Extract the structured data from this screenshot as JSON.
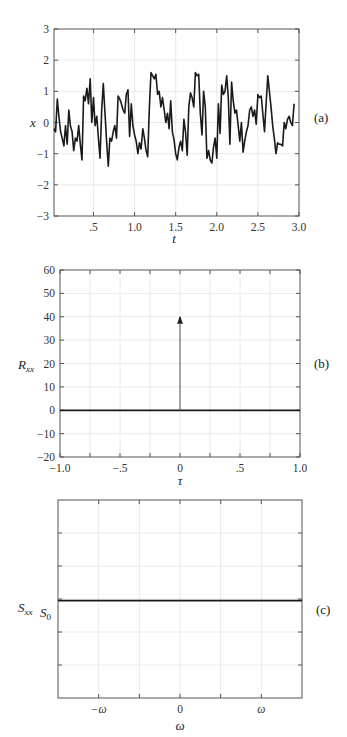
{
  "chart_data": [
    {
      "id": "a",
      "type": "line",
      "panel_label": "(a)",
      "title": "",
      "xlabel": "t",
      "ylabel": "x",
      "xlim": [
        0.02,
        3.0
      ],
      "ylim": [
        -3,
        3
      ],
      "grid": true,
      "x_ticks": [
        0.5,
        1.0,
        1.5,
        2.0,
        2.5,
        3.0
      ],
      "x_tick_labels": [
        ".5",
        "1.0",
        "1.5",
        "2.0",
        "2.5",
        "3.0"
      ],
      "y_ticks": [
        -3,
        -2,
        -1,
        0,
        1,
        2,
        3
      ],
      "y_tick_labels": [
        "−3",
        "−2",
        "−1",
        "0",
        "1",
        "2",
        "3"
      ],
      "series": [
        {
          "name": "x(t) random signal",
          "x": [
            0.02,
            0.04,
            0.06,
            0.08,
            0.1,
            0.12,
            0.14,
            0.16,
            0.18,
            0.2,
            0.22,
            0.24,
            0.26,
            0.28,
            0.3,
            0.32,
            0.34,
            0.36,
            0.38,
            0.4,
            0.42,
            0.44,
            0.46,
            0.48,
            0.5,
            0.52,
            0.54,
            0.56,
            0.58,
            0.6,
            0.62,
            0.64,
            0.66,
            0.68,
            0.7,
            0.72,
            0.74,
            0.76,
            0.78,
            0.8,
            0.82,
            0.84,
            0.86,
            0.88,
            0.9,
            0.92,
            0.94,
            0.96,
            0.98,
            1.0,
            1.02,
            1.04,
            1.06,
            1.08,
            1.1,
            1.12,
            1.14,
            1.16,
            1.18,
            1.2,
            1.22,
            1.24,
            1.26,
            1.28,
            1.3,
            1.32,
            1.34,
            1.36,
            1.38,
            1.4,
            1.42,
            1.44,
            1.46,
            1.48,
            1.5,
            1.52,
            1.54,
            1.56,
            1.58,
            1.6,
            1.62,
            1.64,
            1.66,
            1.68,
            1.7,
            1.72,
            1.74,
            1.76,
            1.78,
            1.8,
            1.82,
            1.84,
            1.86,
            1.88,
            1.9,
            1.92,
            1.94,
            1.96,
            1.98,
            2.0,
            2.02,
            2.04,
            2.06,
            2.08,
            2.1,
            2.12,
            2.14,
            2.16,
            2.18,
            2.2,
            2.22,
            2.24,
            2.26,
            2.28,
            2.3,
            2.32,
            2.34,
            2.36,
            2.38,
            2.4,
            2.42,
            2.44,
            2.46,
            2.48,
            2.5,
            2.52,
            2.54,
            2.56,
            2.58,
            2.6,
            2.62,
            2.64,
            2.66,
            2.68,
            2.7,
            2.72,
            2.74,
            2.76,
            2.78,
            2.8,
            2.82,
            2.84,
            2.86,
            2.88,
            2.9,
            2.92,
            2.94,
            2.96,
            2.98,
            3.0
          ],
          "y": [
            -0.2,
            -0.3,
            0.75,
            0.2,
            -0.3,
            -0.5,
            -0.75,
            -0.1,
            -0.7,
            0.4,
            -0.1,
            -0.3,
            -0.9,
            -0.5,
            -0.6,
            -0.1,
            -0.7,
            -1.2,
            0.85,
            0.7,
            1.1,
            0.6,
            1.4,
            0.0,
            0.8,
            -0.1,
            0.2,
            -0.5,
            -1.15,
            0.4,
            1.25,
            0.3,
            -0.6,
            -1.4,
            -0.5,
            -0.6,
            -0.3,
            -0.1,
            -0.5,
            0.85,
            0.75,
            0.6,
            0.4,
            0.3,
            0.9,
            1.05,
            -0.45,
            0.6,
            -0.1,
            -0.4,
            -0.6,
            -1.0,
            -0.65,
            -0.85,
            -0.2,
            -0.5,
            -0.9,
            -1.1,
            0.5,
            1.6,
            1.5,
            1.4,
            1.55,
            0.9,
            1.0,
            0.5,
            0.8,
            0.4,
            0.0,
            0.3,
            -0.2,
            0.7,
            -0.3,
            -0.55,
            -1.0,
            -1.2,
            -0.8,
            -0.6,
            -0.9,
            0.1,
            -0.3,
            -1.05,
            0.5,
            0.95,
            0.8,
            0.5,
            1.6,
            1.5,
            1.55,
            0.3,
            -0.4,
            1.0,
            0.5,
            -1.15,
            -0.9,
            -1.2,
            -1.3,
            -0.8,
            -0.5,
            -1.15,
            0.6,
            -0.35,
            1.2,
            0.9,
            1.0,
            1.5,
            0.8,
            -0.7,
            1.3,
            0.7,
            0.3,
            0.4,
            -0.1,
            -0.6,
            0.0,
            -0.95,
            -0.6,
            -0.3,
            -0.1,
            0.4,
            0.5,
            0.2,
            0.4,
            -0.05,
            0.9,
            0.8,
            0.85,
            0.3,
            -0.3,
            0.6,
            1.5,
            1.0,
            0.5,
            -0.1,
            -0.5,
            -1.0,
            -0.65,
            -0.7,
            -0.7,
            -0.75,
            0.0,
            -0.2,
            0.1,
            0.2,
            0.0,
            -0.1,
            0.6
          ]
        }
      ]
    },
    {
      "id": "b",
      "type": "line",
      "panel_label": "(b)",
      "title": "",
      "xlabel": "τ",
      "ylabel": "R_xx",
      "xlim": [
        -1.0,
        1.0
      ],
      "ylim": [
        -20,
        60
      ],
      "grid": true,
      "x_ticks": [
        -1.0,
        -0.75,
        -0.5,
        -0.25,
        0,
        0.25,
        0.5,
        0.75,
        1.0
      ],
      "x_tick_labels": [
        "−1.0",
        "",
        "−.5",
        "",
        "0",
        "",
        ".5",
        "",
        "1.0"
      ],
      "y_ticks": [
        -20,
        -10,
        0,
        10,
        20,
        30,
        40,
        50,
        60
      ],
      "y_tick_labels": [
        "−20",
        "−10",
        "0",
        "10",
        "20",
        "30",
        "40",
        "50",
        "60"
      ],
      "series": [
        {
          "name": "baseline",
          "x": [
            -1.0,
            1.0
          ],
          "y": [
            0,
            0
          ]
        },
        {
          "name": "impulse at tau=0 (arrow)",
          "x": [
            0,
            0
          ],
          "y": [
            0,
            40
          ]
        }
      ]
    },
    {
      "id": "c",
      "type": "line",
      "panel_label": "(c)",
      "title": "",
      "xlabel": "ω",
      "ylabel": "S_xx",
      "y_annotation": "S0",
      "xlim": [
        -1.5,
        1.5
      ],
      "ylim": [
        -3,
        3
      ],
      "grid": true,
      "x_ticks": [
        -1.0,
        -0.5,
        0,
        0.5,
        1.0
      ],
      "x_tick_labels": [
        "−ω",
        "",
        "0",
        "",
        "ω"
      ],
      "y_ticks": [
        -2,
        -1,
        0,
        1,
        2
      ],
      "y_tick_labels": [
        "",
        "",
        "",
        "",
        ""
      ],
      "series": [
        {
          "name": "flat spectrum S0",
          "x": [
            -1.5,
            1.5
          ],
          "y": [
            -0.05,
            -0.05
          ]
        }
      ]
    }
  ],
  "labels": {
    "a": {
      "panel": "(a)",
      "xlabel": "t",
      "ylabel": "x"
    },
    "b": {
      "panel": "(b)",
      "xlabel": "τ",
      "ylabel_main": "R",
      "ylabel_sub": "xx"
    },
    "c": {
      "panel": "(c)",
      "xlabel": "ω",
      "ylabel_main": "S",
      "ylabel_sub": "xx",
      "level_main": "S",
      "level_sub": "0"
    }
  }
}
